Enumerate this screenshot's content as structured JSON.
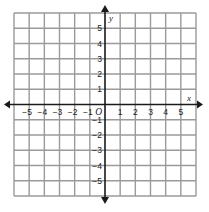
{
  "diagram": {
    "type": "coordinate-plane",
    "x_axis": {
      "label": "x",
      "range": [
        -6,
        6
      ],
      "tick_labels": [
        -5,
        -4,
        -3,
        -2,
        -1,
        1,
        2,
        3,
        4,
        5
      ],
      "arrows": "both"
    },
    "y_axis": {
      "label": "y",
      "range": [
        -6,
        6
      ],
      "tick_labels": [
        -5,
        -4,
        -3,
        -2,
        -1,
        1,
        2,
        3,
        4,
        5
      ],
      "arrows": "both"
    },
    "origin_label": "O",
    "grid": {
      "columns": 12,
      "rows": 12,
      "unit": 1
    },
    "colors": {
      "grid": "#9a9a9a",
      "axes": "#1a1a1a",
      "text": "#222222",
      "background": "#ffffff"
    }
  },
  "layout": {
    "left": 14,
    "right": 196,
    "top": 13,
    "bottom": 196
  }
}
